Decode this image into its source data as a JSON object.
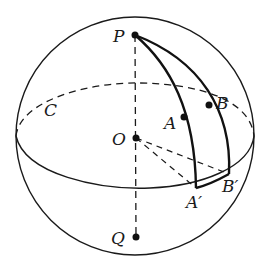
{
  "diagram": {
    "type": "sphere-geometry",
    "colors": {
      "stroke": "#1a1a1a",
      "background": "#ffffff"
    },
    "points": {
      "P": {
        "label": "P",
        "x": 135,
        "y": 35
      },
      "Q": {
        "label": "Q",
        "x": 136,
        "y": 237
      },
      "O": {
        "label": "O",
        "x": 136,
        "y": 138
      },
      "A": {
        "label": "A",
        "x": 184,
        "y": 117
      },
      "B": {
        "label": "B",
        "x": 209,
        "y": 105
      },
      "A_prime": {
        "label": "A′",
        "x": 196,
        "y": 188
      },
      "B_prime": {
        "label": "B′",
        "x": 229,
        "y": 174
      }
    },
    "circle_label": {
      "label": "C",
      "x": 48,
      "y": 112
    }
  }
}
